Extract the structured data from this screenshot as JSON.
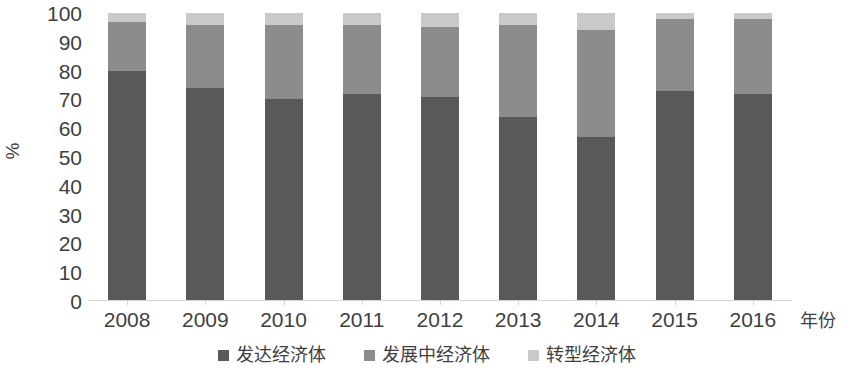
{
  "chart_data": {
    "type": "bar",
    "subtype": "stacked-bar-100-percent",
    "title": "",
    "xlabel": "年份",
    "ylabel": "%",
    "ylim": [
      0,
      100
    ],
    "yticks": [
      100,
      90,
      80,
      70,
      60,
      50,
      40,
      30,
      20,
      10,
      0
    ],
    "grid": false,
    "legend_position": "bottom-center",
    "categories": [
      "2008",
      "2009",
      "2010",
      "2011",
      "2012",
      "2013",
      "2014",
      "2015",
      "2016"
    ],
    "series": [
      {
        "name": "发达经济体",
        "color": "#595959",
        "values": [
          80,
          74,
          70,
          72,
          71,
          64,
          57,
          73,
          72
        ]
      },
      {
        "name": "发展中经济体",
        "color": "#8c8c8c",
        "values": [
          17,
          22,
          26,
          24,
          24,
          32,
          37,
          25,
          26
        ]
      },
      {
        "name": "转型经济体",
        "color": "#c9c9c9",
        "values": [
          3,
          4,
          4,
          4,
          5,
          4,
          6,
          2,
          2
        ]
      }
    ]
  },
  "axes": {
    "y_title": "%",
    "x_title": "年份",
    "y_tick_labels": [
      "100",
      "90",
      "80",
      "70",
      "60",
      "50",
      "40",
      "30",
      "20",
      "10",
      "0"
    ],
    "x_tick_labels": [
      "2008",
      "2009",
      "2010",
      "2011",
      "2012",
      "2013",
      "2014",
      "2015",
      "2016"
    ]
  },
  "legend": {
    "items": [
      {
        "label": "发达经济体",
        "color": "#595959",
        "swatch": "square-marker-icon"
      },
      {
        "label": "发展中经济体",
        "color": "#8c8c8c",
        "swatch": "square-marker-icon"
      },
      {
        "label": "转型经济体",
        "color": "#c9c9c9",
        "swatch": "square-marker-icon"
      }
    ]
  },
  "colors": {
    "developed": "#595959",
    "developing": "#8c8c8c",
    "transition": "#c9c9c9",
    "axis": "#d4d4d4",
    "text": "#3f3f3f",
    "background": "#ffffff"
  }
}
